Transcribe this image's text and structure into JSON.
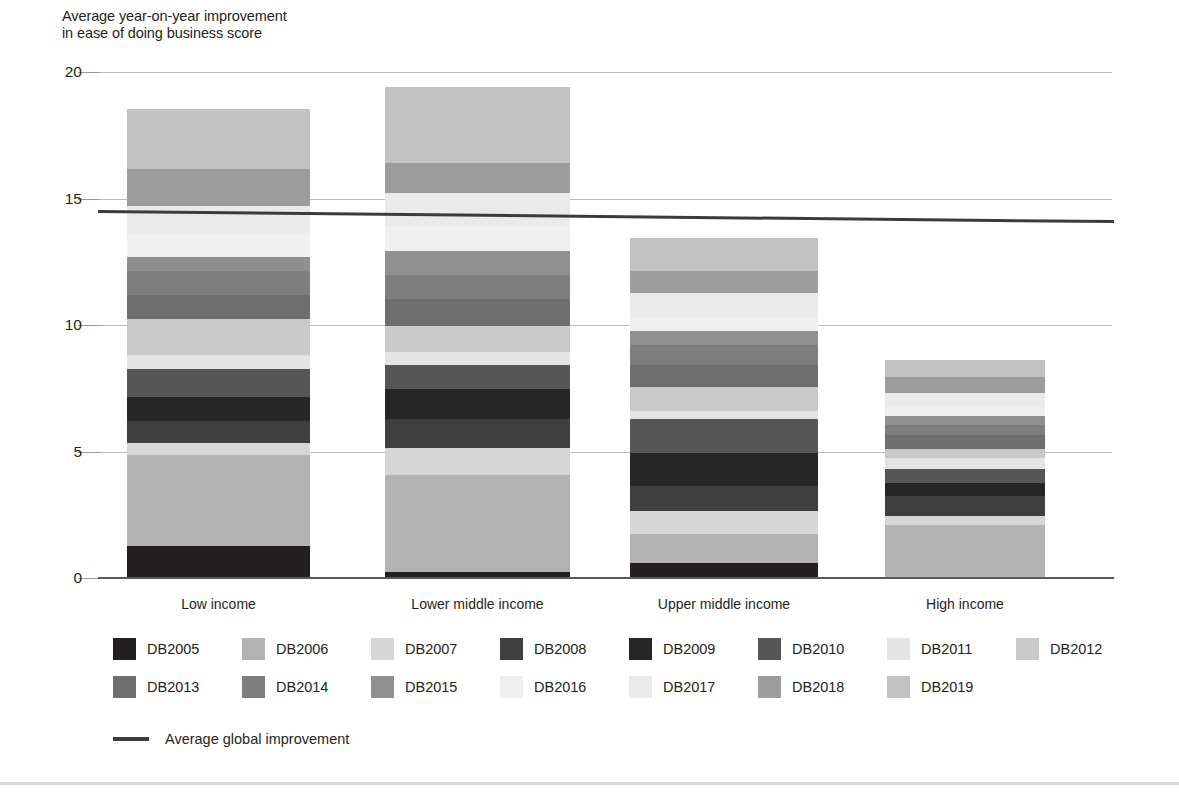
{
  "chart_data": {
    "type": "bar",
    "subtype": "stacked-bar",
    "title": "",
    "ylabel": "Average year-on-year improvement\nin ease of doing business score",
    "xlabel": "",
    "ylim": [
      0,
      20
    ],
    "yticks": [
      0,
      5,
      10,
      15,
      20
    ],
    "ytick_labels": [
      "0",
      "5",
      "10",
      "15",
      "20"
    ],
    "grid": true,
    "legend_position": "bottom",
    "categories": [
      "Low income",
      "Lower middle income",
      "Upper middle income",
      "High income"
    ],
    "series": [
      {
        "name": "DB2005",
        "color": "#231f20",
        "values": [
          1.25,
          0.22,
          0.6,
          0.0
        ]
      },
      {
        "name": "DB2006",
        "color": "#b3b3b3",
        "values": [
          3.6,
          3.85,
          1.15,
          2.1
        ]
      },
      {
        "name": "DB2007",
        "color": "#d6d6d6",
        "values": [
          0.5,
          1.05,
          0.9,
          0.35
        ]
      },
      {
        "name": "DB2008",
        "color": "#3f3f3f",
        "values": [
          0.85,
          1.15,
          1.0,
          0.8
        ]
      },
      {
        "name": "DB2009",
        "color": "#262626",
        "values": [
          0.95,
          1.2,
          1.3,
          0.5
        ]
      },
      {
        "name": "DB2010",
        "color": "#565656",
        "values": [
          1.1,
          0.95,
          1.35,
          0.55
        ]
      },
      {
        "name": "DB2011",
        "color": "#e4e4e4",
        "values": [
          0.55,
          0.5,
          0.3,
          0.45
        ]
      },
      {
        "name": "DB2012",
        "color": "#c9c9c9",
        "values": [
          1.45,
          1.05,
          0.95,
          0.35
        ]
      },
      {
        "name": "DB2013",
        "color": "#6e6e6e",
        "values": [
          0.95,
          1.05,
          0.85,
          0.55
        ]
      },
      {
        "name": "DB2014",
        "color": "#7e7e7e",
        "values": [
          0.95,
          0.95,
          0.8,
          0.4
        ]
      },
      {
        "name": "DB2015",
        "color": "#8f8f8f",
        "values": [
          0.55,
          0.95,
          0.55,
          0.35
        ]
      },
      {
        "name": "DB2016",
        "color": "#efefef",
        "values": [
          0.95,
          1.0,
          0.55,
          0.35
        ]
      },
      {
        "name": "DB2017",
        "color": "#eaeaea",
        "values": [
          1.05,
          1.3,
          0.95,
          0.55
        ]
      },
      {
        "name": "DB2018",
        "color": "#9c9c9c",
        "values": [
          1.45,
          1.2,
          0.9,
          0.65
        ]
      },
      {
        "name": "DB2019",
        "color": "#c2c2c2",
        "values": [
          2.35,
          2.95,
          1.25,
          0.65
        ]
      }
    ],
    "totals": [
      18.55,
      19.37,
      13.4,
      8.1
    ],
    "reference_line": {
      "label": "Average global improvement",
      "value": 14.5,
      "value_left": 14.55,
      "value_right": 14.15,
      "color": "#3b3b3b"
    }
  },
  "legend": {
    "row1": [
      "DB2005",
      "DB2006",
      "DB2007",
      "DB2008",
      "DB2009",
      "DB2010",
      "DB2011",
      "DB2012"
    ],
    "row2": [
      "DB2013",
      "DB2014",
      "DB2015",
      "DB2016",
      "DB2017",
      "DB2018",
      "DB2019"
    ],
    "average_label": "Average global improvement"
  },
  "axis": {
    "title_line1": "Average year-on-year improvement",
    "title_line2": "in ease of doing business score"
  }
}
